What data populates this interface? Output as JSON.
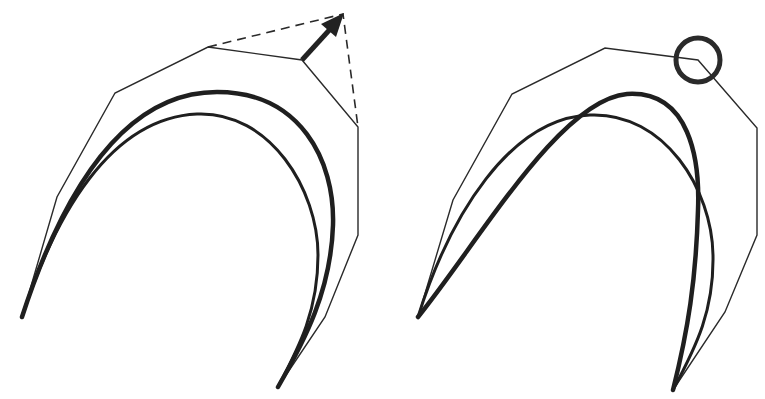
{
  "figure": {
    "colors": {
      "ink": "#1f1f1f",
      "background": "#ffffff"
    },
    "panels": [
      {
        "id": "left",
        "elements": {
          "control_polygon": [
            [
              22,
              317
            ],
            [
              57,
              197
            ],
            [
              115,
              93
            ],
            [
              208,
              47
            ],
            [
              302,
              60
            ],
            [
              358,
              127
            ],
            [
              358,
              235
            ],
            [
              325,
              317
            ],
            [
              278,
              387
            ]
          ],
          "moved_polygon_dashed": [
            [
              208,
              47
            ],
            [
              343,
              14
            ],
            [
              358,
              127
            ]
          ],
          "move_arrow": {
            "from": [
              302,
              60
            ],
            "to": [
              343,
              14
            ],
            "icon": "arrow-icon"
          },
          "original_curve": "thin",
          "modified_curve": "thick"
        }
      },
      {
        "id": "right",
        "elements": {
          "control_polygon": [
            [
              418,
              317
            ],
            [
              453,
              200
            ],
            [
              512,
              94
            ],
            [
              605,
              48
            ],
            [
              698,
              60
            ],
            [
              757,
              128
            ],
            [
              757,
              235
            ],
            [
              725,
              312
            ],
            [
              673,
              390
            ]
          ],
          "highlight_circle": {
            "center": [
              698,
              60
            ],
            "radius": 23,
            "icon": "circle-marker-icon"
          },
          "original_curve": "thin",
          "modified_curve": "thick"
        }
      }
    ]
  }
}
